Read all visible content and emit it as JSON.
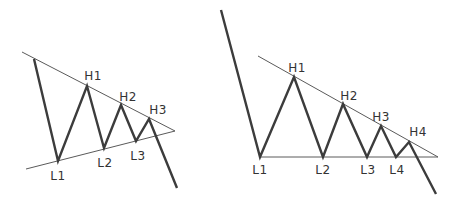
{
  "colors": {
    "background": "#ffffff",
    "price_line": "#3c3c3c",
    "trend_line": "#5a5a5a",
    "label_text": "#333333"
  },
  "diagrams": [
    {
      "name": "symmetrical-triangle",
      "trendlines": {
        "upper": [
          [
            22,
            52
          ],
          [
            175,
            131
          ]
        ],
        "lower": [
          [
            26,
            169
          ],
          [
            175,
            131
          ]
        ]
      },
      "price_path": [
        [
          34,
          59
        ],
        [
          58,
          161
        ],
        [
          87,
          86
        ],
        [
          104,
          148
        ],
        [
          121,
          105
        ],
        [
          136,
          141
        ],
        [
          149,
          119
        ],
        [
          177,
          188
        ]
      ],
      "labels": [
        {
          "text": "H1",
          "x": 93,
          "y": 76
        },
        {
          "text": "H2",
          "x": 128,
          "y": 97
        },
        {
          "text": "H3",
          "x": 158,
          "y": 110
        },
        {
          "text": "L1",
          "x": 58,
          "y": 176
        },
        {
          "text": "L2",
          "x": 105,
          "y": 163
        },
        {
          "text": "L3",
          "x": 138,
          "y": 156
        }
      ]
    },
    {
      "name": "descending-triangle",
      "trendlines": {
        "upper": [
          [
            258,
            56
          ],
          [
            438,
            157
          ]
        ],
        "lower": [
          [
            260,
            157
          ],
          [
            438,
            157
          ]
        ]
      },
      "price_path": [
        [
          221,
          10
        ],
        [
          260,
          157
        ],
        [
          294,
          77
        ],
        [
          323,
          157
        ],
        [
          343,
          104
        ],
        [
          367,
          157
        ],
        [
          381,
          126
        ],
        [
          396,
          157
        ],
        [
          409,
          142
        ],
        [
          436,
          194
        ]
      ],
      "labels": [
        {
          "text": "H1",
          "x": 297,
          "y": 68
        },
        {
          "text": "H2",
          "x": 349,
          "y": 96
        },
        {
          "text": "H3",
          "x": 381,
          "y": 117
        },
        {
          "text": "H4",
          "x": 418,
          "y": 132
        },
        {
          "text": "L1",
          "x": 260,
          "y": 170
        },
        {
          "text": "L2",
          "x": 323,
          "y": 170
        },
        {
          "text": "L3",
          "x": 368,
          "y": 170
        },
        {
          "text": "L4",
          "x": 397,
          "y": 170
        }
      ]
    }
  ]
}
